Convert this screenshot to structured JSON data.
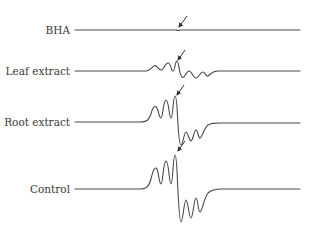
{
  "figure": {
    "traces": [
      {
        "label": "BHA",
        "baseline_y": 30,
        "signal": "flat (nearly no signal)"
      },
      {
        "label": "Leaf extract",
        "baseline_y": 71,
        "signal": "weak oscillation"
      },
      {
        "label": "Root extract",
        "baseline_y": 122,
        "signal": "strong oscillation"
      },
      {
        "label": "Control",
        "baseline_y": 189,
        "signal": "strongest oscillation"
      }
    ],
    "colors": {
      "trace": "#4a4a4a",
      "text": "#3a3a3a",
      "background": "#ffffff"
    }
  }
}
